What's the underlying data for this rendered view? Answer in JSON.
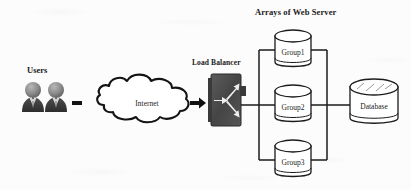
{
  "diagram": {
    "title_right": "Arrays of Web Server",
    "nodes": {
      "users_label": "Users",
      "cloud_label": "Internet",
      "load_balancer_label": "Load Balancer",
      "group1": "Group1",
      "group2": "Group2",
      "group3": "Group3",
      "database": "Database"
    },
    "icons": {
      "user_person": "user-person-icon",
      "cloud": "cloud-icon",
      "load_balancer": "load-balancer-icon",
      "server_cylinder": "server-cylinder-icon",
      "database_cylinder": "database-cylinder-icon",
      "arrow_right": "arrow-right-icon",
      "dash_connector": "dash-connector-icon"
    },
    "colors": {
      "background": "#fcfcfc",
      "stroke": "#1a1a1a",
      "text": "#1a1a1a",
      "user_dark": "#3b3b3b",
      "user_mid": "#6e6e6e",
      "user_light": "#9a9a9a",
      "lb_body": "#4a4a4a",
      "lb_arrow": "#f2f2f2",
      "node_fill": "#ffffff"
    }
  }
}
